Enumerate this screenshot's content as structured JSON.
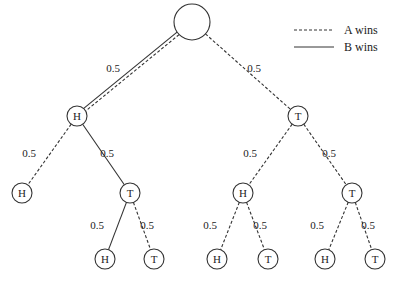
{
  "diagram": {
    "type": "probability-tree",
    "colors": {
      "stroke": "#333333",
      "background": "#ffffff"
    },
    "legend": [
      {
        "style": "dashed",
        "label": "A wins"
      },
      {
        "style": "solid",
        "label": "B wins"
      }
    ],
    "nodes": [
      {
        "id": "root",
        "label": "",
        "x": 192,
        "y": 22,
        "r": 18
      },
      {
        "id": "n1",
        "label": "H",
        "x": 77,
        "y": 116,
        "r": 10
      },
      {
        "id": "n2",
        "label": "T",
        "x": 298,
        "y": 116,
        "r": 10
      },
      {
        "id": "n11",
        "label": "H",
        "x": 22,
        "y": 193,
        "r": 10
      },
      {
        "id": "n12",
        "label": "T",
        "x": 130,
        "y": 193,
        "r": 10
      },
      {
        "id": "n21",
        "label": "H",
        "x": 243,
        "y": 193,
        "r": 10
      },
      {
        "id": "n22",
        "label": "T",
        "x": 352,
        "y": 193,
        "r": 10
      },
      {
        "id": "n121",
        "label": "H",
        "x": 105,
        "y": 259,
        "r": 10
      },
      {
        "id": "n122",
        "label": "T",
        "x": 154,
        "y": 259,
        "r": 10
      },
      {
        "id": "n211",
        "label": "H",
        "x": 217,
        "y": 259,
        "r": 10
      },
      {
        "id": "n212",
        "label": "T",
        "x": 268,
        "y": 259,
        "r": 10
      },
      {
        "id": "n221",
        "label": "H",
        "x": 325,
        "y": 259,
        "r": 10
      },
      {
        "id": "n222",
        "label": "T",
        "x": 375,
        "y": 259,
        "r": 10
      }
    ],
    "edges": [
      {
        "from": "root",
        "to": "n1",
        "style": "both",
        "prob": "0.5",
        "lx": 113,
        "ly": 72
      },
      {
        "from": "root",
        "to": "n2",
        "style": "dashed",
        "prob": "0.5",
        "lx": 254,
        "ly": 72
      },
      {
        "from": "n1",
        "to": "n11",
        "style": "dashed",
        "prob": "0.5",
        "lx": 29,
        "ly": 157
      },
      {
        "from": "n1",
        "to": "n12",
        "style": "solid",
        "prob": "0.5",
        "lx": 107,
        "ly": 157
      },
      {
        "from": "n12",
        "to": "n121",
        "style": "solid",
        "prob": "0.5",
        "lx": 97,
        "ly": 229
      },
      {
        "from": "n12",
        "to": "n122",
        "style": "dashed",
        "prob": "0.5",
        "lx": 147,
        "ly": 229
      },
      {
        "from": "n2",
        "to": "n21",
        "style": "dashed",
        "prob": "0.5",
        "lx": 250,
        "ly": 157
      },
      {
        "from": "n2",
        "to": "n22",
        "style": "dashed",
        "prob": "0.5",
        "lx": 329,
        "ly": 157
      },
      {
        "from": "n21",
        "to": "n211",
        "style": "dashed",
        "prob": "0.5",
        "lx": 210,
        "ly": 229
      },
      {
        "from": "n21",
        "to": "n212",
        "style": "dashed",
        "prob": "0.5",
        "lx": 260,
        "ly": 229
      },
      {
        "from": "n22",
        "to": "n221",
        "style": "dashed",
        "prob": "0.5",
        "lx": 317,
        "ly": 229
      },
      {
        "from": "n22",
        "to": "n222",
        "style": "dashed",
        "prob": "0.5",
        "lx": 368,
        "ly": 229
      }
    ]
  }
}
